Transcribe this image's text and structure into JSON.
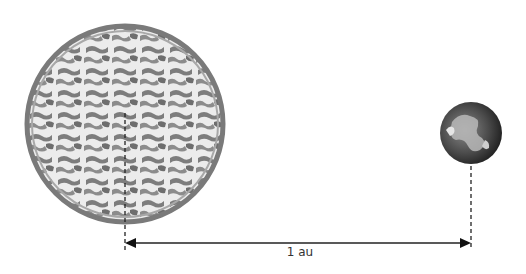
{
  "diagram": {
    "sun": {
      "name": "Sun",
      "cx": 125,
      "cy": 124,
      "r": 98,
      "fill": "#bdbdbd",
      "edge": "#7a7a7a"
    },
    "earth": {
      "name": "Earth",
      "cx": 471,
      "cy": 133,
      "r": 31,
      "fill": "#2a2a2a"
    },
    "distance": {
      "label": "1 au",
      "y": 243,
      "x1": 125,
      "x2": 471
    }
  }
}
